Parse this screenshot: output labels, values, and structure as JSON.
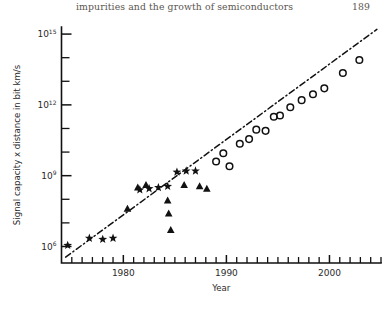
{
  "running_head": {
    "title": "impurities and the growth of semiconductors",
    "page_number": "189"
  },
  "chart_data": {
    "type": "scatter",
    "title": "",
    "xlabel": "Year",
    "ylabel": "Signal capacity x distance in bit km/s",
    "xlim": [
      1974,
      2005
    ],
    "ylim_log10": [
      5.3,
      15.3
    ],
    "yscale": "log",
    "xscale": "linear",
    "grid": false,
    "legend": "none",
    "x_ticks_major": [
      1980,
      1990,
      2000
    ],
    "x_tick_labels": [
      "1980",
      "1990",
      "2000"
    ],
    "x_ticks_minor_step": 1,
    "y_ticks_major_log10": [
      6,
      9,
      12,
      15
    ],
    "y_tick_labels": [
      "10⁶",
      "10⁹",
      "10¹²",
      "10¹⁵"
    ],
    "y_tick_mantissas": [
      "10",
      "10",
      "10",
      "10"
    ],
    "y_tick_exponents": [
      "6",
      "9",
      "12",
      "15"
    ],
    "y_ticks_minor_log10": [
      7,
      8,
      10,
      11,
      13,
      14
    ],
    "trendline": {
      "style": "dash-dot",
      "x_start": 1974.4,
      "y_start_log10": 5.55,
      "x_end": 2004.6,
      "y_end_log10": 15.2
    },
    "series": [
      {
        "name": "stars",
        "marker": "star",
        "color": "#111111",
        "points": [
          {
            "x": 1974.6,
            "y_log10": 6.05
          },
          {
            "x": 1976.7,
            "y_log10": 6.35
          },
          {
            "x": 1978.0,
            "y_log10": 6.3
          },
          {
            "x": 1979.0,
            "y_log10": 6.35
          },
          {
            "x": 1981.6,
            "y_log10": 8.4
          },
          {
            "x": 1982.5,
            "y_log10": 8.45
          },
          {
            "x": 1983.4,
            "y_log10": 8.5
          },
          {
            "x": 1984.3,
            "y_log10": 8.55
          },
          {
            "x": 1985.2,
            "y_log10": 9.15
          },
          {
            "x": 1986.1,
            "y_log10": 9.2
          },
          {
            "x": 1987.0,
            "y_log10": 9.2
          }
        ]
      },
      {
        "name": "triangles",
        "marker": "triangle",
        "color": "#111111",
        "points": [
          {
            "x": 1980.4,
            "y_log10": 7.6
          },
          {
            "x": 1981.4,
            "y_log10": 8.5
          },
          {
            "x": 1982.2,
            "y_log10": 8.6
          },
          {
            "x": 1984.3,
            "y_log10": 7.95
          },
          {
            "x": 1984.4,
            "y_log10": 7.4
          },
          {
            "x": 1984.6,
            "y_log10": 6.7
          },
          {
            "x": 1985.9,
            "y_log10": 8.6
          },
          {
            "x": 1987.4,
            "y_log10": 8.55
          },
          {
            "x": 1988.1,
            "y_log10": 8.45
          }
        ]
      },
      {
        "name": "circles",
        "marker": "circle",
        "color": "#111111",
        "points": [
          {
            "x": 1989.0,
            "y_log10": 9.6
          },
          {
            "x": 1989.7,
            "y_log10": 9.95
          },
          {
            "x": 1990.3,
            "y_log10": 9.4
          },
          {
            "x": 1991.3,
            "y_log10": 10.35
          },
          {
            "x": 1992.2,
            "y_log10": 10.55
          },
          {
            "x": 1992.9,
            "y_log10": 10.95
          },
          {
            "x": 1993.8,
            "y_log10": 10.9
          },
          {
            "x": 1994.6,
            "y_log10": 11.5
          },
          {
            "x": 1995.2,
            "y_log10": 11.55
          },
          {
            "x": 1996.2,
            "y_log10": 11.9
          },
          {
            "x": 1997.3,
            "y_log10": 12.2
          },
          {
            "x": 1998.4,
            "y_log10": 12.45
          },
          {
            "x": 1999.5,
            "y_log10": 12.7
          },
          {
            "x": 2001.3,
            "y_log10": 13.35
          },
          {
            "x": 2002.9,
            "y_log10": 13.9
          }
        ]
      }
    ]
  }
}
